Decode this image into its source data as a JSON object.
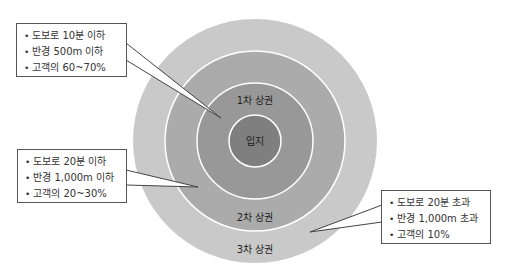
{
  "diagram": {
    "center": {
      "cx": 255,
      "cy": 141
    },
    "rings": [
      {
        "id": "3rd-trade-area",
        "label": "3차 상권",
        "radius": 122,
        "color": "#c9c9c9",
        "label_y": 250
      },
      {
        "id": "2nd-trade-area",
        "label": "2차 상권",
        "radius": 90,
        "color": "#ababab",
        "label_y": 218
      },
      {
        "id": "1st-trade-area",
        "label": "1차 상권",
        "radius": 58,
        "color": "#989898",
        "label_y": 101
      },
      {
        "id": "location",
        "label": "입지",
        "radius": 26,
        "color": "#7f7f7f",
        "label_y": 142
      }
    ],
    "ring_border_color": "#ffffff"
  },
  "callouts": [
    {
      "target": "1차 상권",
      "items": [
        "도보로 10분 이하",
        "반경 500m 이하",
        "고객의 60~70%"
      ]
    },
    {
      "target": "2차 상권",
      "items": [
        "도보로 20분 이하",
        "반경 1,000m 이하",
        "고객의 20~30%"
      ]
    },
    {
      "target": "3차 상권",
      "items": [
        "도보로 20분 초과",
        "반경 1,000m 초과",
        "고객의 10%"
      ]
    }
  ]
}
